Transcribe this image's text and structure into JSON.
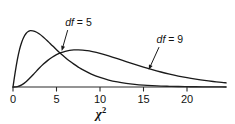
{
  "chart_data": {
    "type": "line",
    "title": "",
    "subtitle": "",
    "xlabel": "x^2",
    "xlabel_base": "χ",
    "xlabel_exponent": "2",
    "ylabel": "",
    "xlim": [
      0,
      24.5
    ],
    "ylim": [
      0,
      0.16
    ],
    "xticks": [
      0,
      5,
      10,
      15,
      20
    ],
    "xtick_labels": [
      "0",
      "5",
      "10",
      "15",
      "20"
    ],
    "yticks": [],
    "ytick_labels": [],
    "grid": false,
    "legend": "none",
    "annotations": [
      {
        "name": "df-5-annotation",
        "text_prefix": "df",
        "text_suffix": " = 5",
        "text": "df = 5",
        "label_x": 6.0,
        "label_y": 0.148,
        "arrow_to_x": 5.6,
        "arrow_to_y": 0.087
      },
      {
        "name": "df-9-annotation",
        "text_prefix": "df",
        "text_suffix": " = 9",
        "text": "df = 9",
        "label_x": 16.5,
        "label_y": 0.107,
        "arrow_to_x": 15.6,
        "arrow_to_y": 0.0415
      }
    ],
    "series": [
      {
        "name": "df = 5",
        "df": 5,
        "color": "#1a1a1a",
        "peak_x": 3.0,
        "peak_y": 0.1542,
        "x": [
          0.0,
          0.25,
          0.5,
          0.75,
          1.0,
          1.25,
          1.5,
          1.75,
          2.0,
          2.5,
          3.0,
          3.5,
          4.0,
          4.5,
          5.0,
          5.5,
          6.0,
          6.5,
          7.0,
          7.5,
          8.0,
          9.0,
          10.0,
          11.0,
          12.0,
          13.0,
          14.0,
          15.0,
          16.0,
          17.0,
          18.0,
          19.0,
          20.0,
          21.0,
          22.0,
          23.0,
          24.0,
          24.5
        ],
        "values": [
          0.0,
          0.0353,
          0.066,
          0.0901,
          0.108,
          0.1206,
          0.1288,
          0.1336,
          0.1358,
          0.1342,
          0.1283,
          0.12,
          0.1104,
          0.1002,
          0.09,
          0.0803,
          0.0712,
          0.0627,
          0.055,
          0.048,
          0.0418,
          0.0312,
          0.023,
          0.0168,
          0.0122,
          0.0088,
          0.0063,
          0.0045,
          0.0032,
          0.0022,
          0.0016,
          0.0011,
          0.0008,
          0.0005,
          0.0004,
          0.0003,
          0.0002,
          0.0001
        ]
      },
      {
        "name": "df = 9",
        "df": 9,
        "color": "#1a1a1a",
        "peak_x": 7.0,
        "peak_y": 0.1005,
        "x": [
          0.0,
          0.5,
          1.0,
          1.5,
          2.0,
          2.5,
          3.0,
          3.5,
          4.0,
          4.5,
          5.0,
          5.5,
          6.0,
          6.5,
          7.0,
          7.5,
          8.0,
          8.5,
          9.0,
          10.0,
          11.0,
          12.0,
          13.0,
          14.0,
          15.0,
          16.0,
          17.0,
          18.0,
          19.0,
          20.0,
          21.0,
          22.0,
          23.0,
          24.0,
          24.5
        ],
        "values": [
          0.0,
          0.0008,
          0.0051,
          0.0128,
          0.023,
          0.034,
          0.045,
          0.0552,
          0.0642,
          0.0717,
          0.0779,
          0.0826,
          0.086,
          0.0882,
          0.0893,
          0.0895,
          0.0889,
          0.0877,
          0.0859,
          0.0811,
          0.075,
          0.0683,
          0.0614,
          0.0546,
          0.048,
          0.0418,
          0.0361,
          0.031,
          0.0264,
          0.0224,
          0.0189,
          0.0158,
          0.0132,
          0.011,
          0.01
        ]
      }
    ]
  }
}
